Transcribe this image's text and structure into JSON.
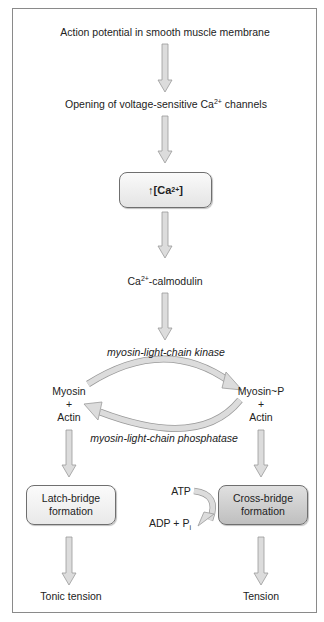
{
  "steps": {
    "action_potential": "Action potential in smooth muscle membrane",
    "channels_prefix": "Opening of voltage-sensitive Ca",
    "channels_sup": "2+",
    "channels_suffix": " channels",
    "ca_box_arrow": "↑",
    "ca_box_prefix": " [Ca",
    "ca_box_sup": "2+",
    "ca_box_suffix": "]",
    "calmodulin_prefix": "Ca",
    "calmodulin_sup": "2+",
    "calmodulin_suffix": "-calmodulin"
  },
  "cycle": {
    "kinase": "myosin-light-chain kinase",
    "phosphatase": "myosin-light-chain phosphatase",
    "left": {
      "line1": "Myosin",
      "line2": "+",
      "line3": "Actin"
    },
    "right": {
      "line1": "Myosin~P",
      "line2": "+",
      "line3": "Actin"
    }
  },
  "branches": {
    "latch": {
      "line1": "Latch-bridge",
      "line2": "formation",
      "outcome": "Tonic tension"
    },
    "cross": {
      "line1": "Cross-bridge",
      "line2": "formation",
      "outcome": "Tension"
    },
    "atp": "ATP",
    "adp_prefix": "ADP + P",
    "adp_sub": "i"
  },
  "colors": {
    "arrow_fill": "#dcdcdc",
    "arrow_stroke": "#9a9a9a",
    "frame": "#8a8a8a",
    "cross_box": "#c8c8c8"
  }
}
